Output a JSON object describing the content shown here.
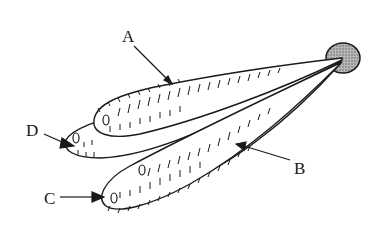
{
  "diagram": {
    "type": "labeled-illustration",
    "labels": [
      {
        "id": "A",
        "text": "A",
        "x": 122,
        "y": 28
      },
      {
        "id": "B",
        "text": "B",
        "x": 295,
        "y": 160
      },
      {
        "id": "C",
        "text": "C",
        "x": 44,
        "y": 192
      },
      {
        "id": "D",
        "text": "D",
        "x": 27,
        "y": 123
      }
    ],
    "colors": {
      "ink": "#1a1a1a",
      "attachment_fill": "#9a9a9a",
      "background": "#ffffff"
    }
  }
}
